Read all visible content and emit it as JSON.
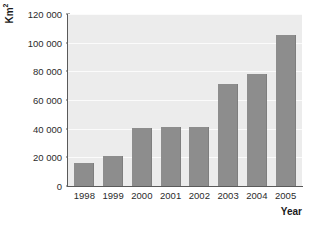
{
  "chart_data": {
    "type": "bar",
    "title": "",
    "subtitle": "",
    "xlabel": "Year",
    "ylabel": "Km²",
    "categories": [
      "1998",
      "1999",
      "2000",
      "2001",
      "2002",
      "2003",
      "2004",
      "2005"
    ],
    "values": [
      16000,
      21000,
      40500,
      41000,
      41500,
      71500,
      78000,
      105500
    ],
    "ylim": [
      0,
      120000
    ],
    "ytick_values": [
      0,
      20000,
      40000,
      60000,
      80000,
      100000,
      120000
    ],
    "ytick_labels": [
      "0",
      "20 000",
      "40 000",
      "60 000",
      "80 000",
      "100 000",
      "120 000"
    ],
    "grid": true,
    "legend": null,
    "series": [
      {
        "name": "Area",
        "values": [
          16000,
          21000,
          40500,
          41000,
          41500,
          71500,
          78000,
          105500
        ]
      }
    ]
  },
  "style": {
    "bar_color": "#8d8d8d",
    "plot_background": "#ececec",
    "gridline_color": "#fbfbfb",
    "axis_color": "#5a5a5a",
    "page_background": "#ffffff",
    "text_color": "#2b2b2b"
  },
  "axis_titles": {
    "y_main": "Km",
    "y_superscript": "2",
    "x": "Year"
  }
}
